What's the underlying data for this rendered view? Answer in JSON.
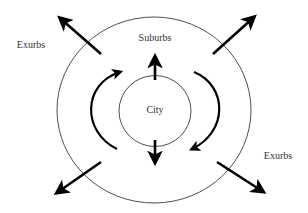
{
  "diagram": {
    "labels": {
      "city": "City",
      "suburbs": "Suburbs",
      "exurbs_left": "Exurbs",
      "exurbs_right": "Exurbs"
    },
    "colors": {
      "line": "#222222",
      "arrow": "#000000",
      "text": "#333333",
      "background": "#ffffff"
    }
  }
}
